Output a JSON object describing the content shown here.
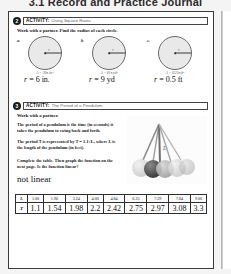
{
  "runhead": "3.1 Record and Practice Journal",
  "activity2": {
    "number": "2",
    "word": "ACTIVITY:",
    "title": "Using Square Roots",
    "instruction": "Work with a partner. Find the radius of each circle.",
    "circles": [
      {
        "label": "a.",
        "area": "A = 36π in.²",
        "radius_mark": "r",
        "answer_prefix": "r",
        "answer": " = 6 in."
      },
      {
        "label": "b.",
        "area": "A = 81π yd²",
        "radius_mark": "r",
        "answer_prefix": "r",
        "answer": " = 9 yd"
      },
      {
        "label": "c.",
        "area": "A = 0.25π ft²",
        "radius_mark": "r",
        "answer_prefix": "r",
        "answer": " = 0.5 ft"
      }
    ]
  },
  "activity3": {
    "number": "3",
    "word": "ACTIVITY:",
    "title": "The Period of a Pendulum",
    "line1": "Work with a partner.",
    "line2": "The period of a pendulum is the time (in seconds) it takes the pendulum to swing back and forth.",
    "line3": "The period T is represented by T = 1.1√L, where L is the length of the pendulum (in feet).",
    "line4": "Complete the table. Then graph the function on the next page. Is the function linear?",
    "handwritten_answer": "not linear",
    "photo_name": "newtons-cradle-pendulum-photo"
  },
  "table": {
    "row_keys": [
      "L",
      "T"
    ],
    "headers": [
      "L",
      "1.00",
      "1.96",
      "3.24",
      "4.00",
      "4.84",
      "6.25",
      "7.29",
      "7.84",
      "9.00"
    ],
    "values": [
      "T",
      "1.1",
      "1.54",
      "1.98",
      "2.2",
      "2.42",
      "2.75",
      "2.97",
      "3.08",
      "3.3"
    ]
  },
  "colors": {
    "ink": "#1a1a1a",
    "rule": "#3c3c3c",
    "circle_fill": "#e9e9e9",
    "muted": "#6b6b6b"
  }
}
